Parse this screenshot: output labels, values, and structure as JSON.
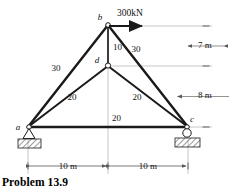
{
  "figure": {
    "caption": "Problem 13.9",
    "nodes": [
      {
        "id": "a",
        "label": "a",
        "x": 28,
        "y": 127,
        "support": "pin"
      },
      {
        "id": "b",
        "label": "b",
        "x": 108,
        "y": 25,
        "support": "none"
      },
      {
        "id": "c",
        "label": "c",
        "x": 188,
        "y": 127,
        "support": "roller"
      },
      {
        "id": "d",
        "label": "d",
        "x": 108,
        "y": 65,
        "support": "none"
      }
    ],
    "members": [
      {
        "from": "a",
        "to": "b",
        "label": "30"
      },
      {
        "from": "b",
        "to": "d",
        "label": "10"
      },
      {
        "from": "b",
        "to": "c",
        "label": "30"
      },
      {
        "from": "a",
        "to": "d",
        "label": "20"
      },
      {
        "from": "d",
        "to": "c",
        "label": "20"
      },
      {
        "from": "a",
        "to": "c",
        "label": "20"
      }
    ],
    "member_labels": [
      {
        "name": "member-ab-label",
        "text": "30",
        "x": 56,
        "y": 71
      },
      {
        "name": "member-bd-label",
        "text": "10",
        "x": 113,
        "y": 50
      },
      {
        "name": "member-bc-label",
        "text": "30",
        "x": 136,
        "y": 52
      },
      {
        "name": "member-ad-label",
        "text": "20",
        "x": 72,
        "y": 100
      },
      {
        "name": "member-dc-label",
        "text": "20",
        "x": 137,
        "y": 100
      },
      {
        "name": "member-ac-label",
        "text": "20",
        "x": 112,
        "y": 121
      }
    ],
    "node_labels": [
      {
        "name": "node-label-a",
        "text": "a",
        "x": 18,
        "y": 130
      },
      {
        "name": "node-label-b",
        "text": "b",
        "x": 100,
        "y": 20
      },
      {
        "name": "node-label-c",
        "text": "c",
        "x": 192,
        "y": 122
      },
      {
        "name": "node-label-d",
        "text": "d",
        "x": 97,
        "y": 63
      }
    ],
    "load": {
      "label": "300kN",
      "label_x": 117,
      "label_y": 16,
      "arrow_from_x": 108,
      "arrow_from_y": 26,
      "arrow_to_x": 144,
      "arrow_to_y": 26,
      "direction": "right"
    },
    "dimensions": [
      {
        "name": "dimension-height-top",
        "text": "7 m",
        "orientation": "vertical",
        "x": 205,
        "y": 48
      },
      {
        "name": "dimension-height-bottom",
        "text": "8 m",
        "orientation": "vertical",
        "x": 205,
        "y": 98
      },
      {
        "name": "dimension-span-left",
        "text": "10 m",
        "orientation": "horizontal",
        "x": 68,
        "y": 166
      },
      {
        "name": "dimension-span-right",
        "text": "10 m",
        "orientation": "horizontal",
        "x": 148,
        "y": 166
      }
    ],
    "colors": {
      "member": "#1a1a1a",
      "dimension_line": "#8a8a8a",
      "hatch": "#333333",
      "text": "#111111",
      "background": "#ffffff"
    }
  }
}
